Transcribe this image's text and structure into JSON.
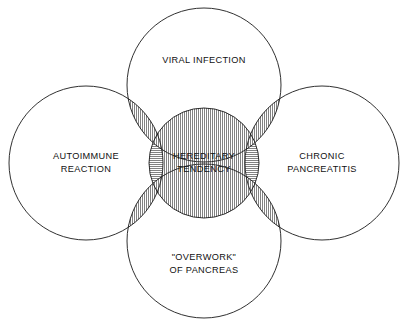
{
  "diagram": {
    "type": "venn",
    "title": "",
    "background_color": "#ffffff",
    "stroke_color": "#1a1a1a",
    "text_color": "#111111",
    "outer_circles": [
      {
        "id": "left",
        "label_line1": "AUTOIMMUNE",
        "label_line2": "REACTION",
        "cx": 86,
        "cy": 163,
        "r": 77
      },
      {
        "id": "top",
        "label_line1": "VIRAL INFECTION",
        "label_line2": "",
        "cx": 204,
        "cy": 85,
        "r": 77
      },
      {
        "id": "right",
        "label_line1": "CHRONIC",
        "label_line2": "PANCREATITIS",
        "cx": 322,
        "cy": 163,
        "r": 77
      },
      {
        "id": "bottom",
        "label_line1": "\"OVERWORK\"",
        "label_line2": "OF PANCREAS",
        "cx": 204,
        "cy": 241,
        "r": 77
      }
    ],
    "center_circle": {
      "id": "center",
      "label_line1": "HEREDITARY",
      "label_line2": "TENDENCY",
      "cx": 204,
      "cy": 163,
      "r": 55
    },
    "hatching": {
      "horizontal_regions": "left-lens, right-lens",
      "vertical_regions": "top-lens, bottom-lens, center-band",
      "line_color": "#333333",
      "spacing_px": 2
    }
  }
}
